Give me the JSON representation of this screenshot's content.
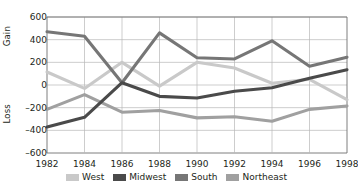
{
  "chart_data": {
    "type": "line",
    "title": "",
    "xlabel": "",
    "ylabel": "Gain / Loss",
    "gain_label": "Gain",
    "loss_label": "Loss",
    "categories": [
      "1982",
      "1984",
      "1986",
      "1988",
      "1990",
      "1992",
      "1994",
      "1996",
      "1998"
    ],
    "x": [
      1982,
      1984,
      1986,
      1988,
      1990,
      1992,
      1994,
      1996,
      1998
    ],
    "ylim": [
      -600,
      600
    ],
    "yticks": [
      600,
      400,
      200,
      0,
      -200,
      -400,
      -600
    ],
    "ytick_labels": [
      "600",
      "400",
      "200",
      "0",
      "–200",
      "–400",
      "–600"
    ],
    "grid": true,
    "legend_position": "bottom",
    "series": [
      {
        "name": "West",
        "color": "#c9c9c9",
        "values": [
          115,
          -30,
          200,
          -10,
          200,
          150,
          15,
          50,
          -130
        ]
      },
      {
        "name": "Midwest",
        "color": "#4a4a4a",
        "values": [
          -370,
          -285,
          20,
          -100,
          -115,
          -55,
          -25,
          60,
          135
        ]
      },
      {
        "name": "South",
        "color": "#767676",
        "values": [
          470,
          430,
          20,
          460,
          240,
          230,
          390,
          165,
          245
        ]
      },
      {
        "name": "Northeast",
        "color": "#a0a0a0",
        "values": [
          -215,
          -85,
          -240,
          -225,
          -290,
          -280,
          -320,
          -215,
          -185
        ]
      }
    ]
  },
  "style": {
    "axis_color": "#6f6f6f",
    "grid_color": "#b8b8b8",
    "text_color": "#231f20",
    "background": "#ffffff"
  }
}
